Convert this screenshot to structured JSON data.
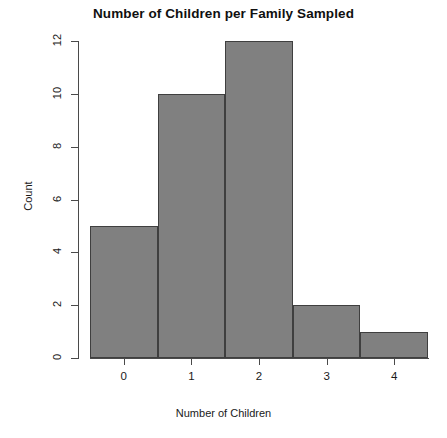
{
  "chart_data": {
    "type": "bar",
    "title": "Number of Children per Family Sampled",
    "xlabel": "Number of Children",
    "ylabel": "Count",
    "categories": [
      "0",
      "1",
      "2",
      "3",
      "4"
    ],
    "values": [
      5,
      10,
      12,
      2,
      1
    ],
    "ylim": [
      0,
      12
    ],
    "yticks": [
      0,
      2,
      4,
      6,
      8,
      10,
      12
    ],
    "ytick_labels": [
      "0",
      "2",
      "4",
      "6",
      "8",
      "10",
      "12"
    ],
    "xtick_labels": [
      "0",
      "1",
      "2",
      "3",
      "4"
    ],
    "grid": false,
    "legend": false,
    "bar_fill_color": "#808080",
    "bar_border_color": "#3f3f3f",
    "axis_color": "#4a4a4a",
    "background_color": "#ffffff",
    "bar_gap": 0
  }
}
